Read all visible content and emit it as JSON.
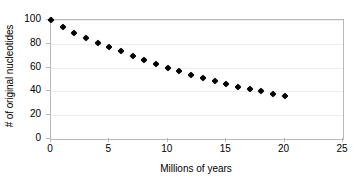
{
  "chart_data": {
    "type": "scatter",
    "title": "",
    "xlabel": "Millions of years",
    "ylabel": "# of original nucleotides",
    "xlim": [
      0,
      25
    ],
    "ylim": [
      0,
      100
    ],
    "xticks": [
      0,
      5,
      10,
      15,
      20,
      25
    ],
    "yticks": [
      0,
      20,
      40,
      60,
      80,
      100
    ],
    "grid": true,
    "legend": false,
    "marker": "diamond",
    "marker_color": "#000000",
    "x": [
      0,
      1,
      2,
      3,
      4,
      5,
      6,
      7,
      8,
      9,
      10,
      11,
      12,
      13,
      14,
      15,
      16,
      17,
      18,
      19,
      20
    ],
    "values": [
      100,
      94,
      89,
      85,
      81,
      77,
      74,
      70,
      66,
      63,
      60,
      57,
      54,
      51,
      49,
      46,
      44,
      42,
      40,
      38,
      36
    ],
    "series": [
      {
        "name": "nucleotides",
        "values": [
          100,
          94,
          89,
          85,
          81,
          77,
          74,
          70,
          66,
          63,
          60,
          57,
          54,
          51,
          49,
          46,
          44,
          42,
          40,
          38,
          36
        ]
      }
    ]
  },
  "axes": {
    "y_title": "# of original nucleotides",
    "x_title": "Millions of years",
    "y_tick_labels": [
      "100",
      "80",
      "60",
      "40",
      "20",
      "0"
    ],
    "x_tick_labels": [
      "0",
      "5",
      "10",
      "15",
      "20",
      "25"
    ]
  },
  "colors": {
    "marker": "#000000",
    "frame": "#b9b9b9",
    "gridline": "#ededed",
    "background": "#ffffff"
  }
}
